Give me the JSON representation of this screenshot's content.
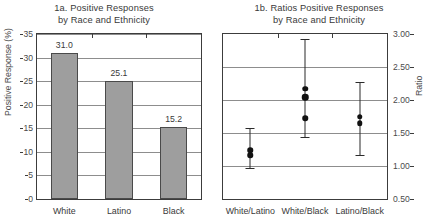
{
  "chart_data": [
    {
      "type": "bar",
      "panel": "1a",
      "title_line1": "1a. Positive Responses",
      "title_line2": "by Race and Ethnicity",
      "xlabel": "",
      "ylabel": "Positive Response (%)",
      "ylim": [
        0,
        35
      ],
      "yticks": [
        0,
        5,
        10,
        15,
        20,
        25,
        30,
        35
      ],
      "ytick_labels": [
        "0",
        "5",
        "10",
        "15",
        "20",
        "25",
        "30",
        "35"
      ],
      "grid": true,
      "legend": "none",
      "categories": [
        "White",
        "Latino",
        "Black"
      ],
      "values": [
        31.0,
        25.1,
        15.2
      ],
      "value_labels": [
        "31.0",
        "25.1",
        "15.2"
      ],
      "bar_fill": "#9e9e9e",
      "bar_stroke": "#4a4a4a"
    },
    {
      "type": "scatter",
      "panel": "1b",
      "title_line1": "1b. Ratios Positive Responses",
      "title_line2": "by Race and Ethnicity",
      "xlabel": "",
      "ylabel": "Ratio",
      "ylim": [
        0.5,
        3.0
      ],
      "yticks": [
        0.5,
        1.0,
        1.5,
        2.0,
        2.5,
        3.0
      ],
      "ytick_labels": [
        "0.50",
        "1.00",
        "1.50",
        "2.00",
        "2.50",
        "3.00"
      ],
      "axis_side": "right",
      "grid": true,
      "legend": "none",
      "categories": [
        "White/Latino",
        "White/Black",
        "Latino/Black"
      ],
      "groups": [
        {
          "name": "White/Latino",
          "points": [
            1.24,
            1.16
          ],
          "ci_low": 0.97,
          "ci_high": 1.57
        },
        {
          "name": "White/Black",
          "points": [
            2.17,
            2.04,
            1.72
          ],
          "ci_low": 1.44,
          "ci_high": 2.93
        },
        {
          "name": "Latino/Black",
          "points": [
            1.75,
            1.65
          ],
          "ci_low": 1.17,
          "ci_high": 2.28
        }
      ],
      "marker_color": "#111111",
      "errorbar_color": "#2b2b2b"
    }
  ]
}
